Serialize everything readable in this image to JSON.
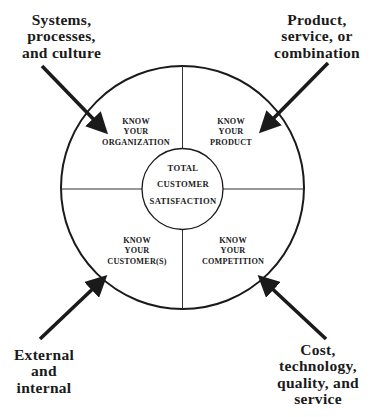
{
  "diagram": {
    "center": {
      "lines": [
        "TOTAL",
        "CUSTOMER",
        "SATISFACTION"
      ]
    },
    "quadrants": [
      {
        "id": "organization",
        "position": "top-left",
        "lines": [
          "KNOW",
          "YOUR",
          "ORGANIZATION"
        ]
      },
      {
        "id": "product",
        "position": "top-right",
        "lines": [
          "KNOW",
          "YOUR",
          "PRODUCT"
        ]
      },
      {
        "id": "customers",
        "position": "bottom-left",
        "lines": [
          "KNOW",
          "YOUR",
          "CUSTOMER(S)"
        ]
      },
      {
        "id": "competition",
        "position": "bottom-right",
        "lines": [
          "KNOW",
          "YOUR",
          "COMPETITION"
        ]
      }
    ],
    "external_inputs": [
      {
        "id": "systems",
        "target": "organization",
        "lines": [
          "Systems,",
          "processes,",
          "and culture"
        ]
      },
      {
        "id": "product-type",
        "target": "product",
        "lines": [
          "Product,",
          "service, or",
          "combination"
        ]
      },
      {
        "id": "customer-type",
        "target": "customers",
        "lines": [
          "External",
          "and",
          "internal"
        ]
      },
      {
        "id": "competition-factors",
        "target": "competition",
        "lines": [
          "Cost,",
          "technology,",
          "quality, and",
          "service"
        ]
      }
    ],
    "colors": {
      "stroke": "#1a1a1a",
      "background": "#ffffff"
    }
  }
}
